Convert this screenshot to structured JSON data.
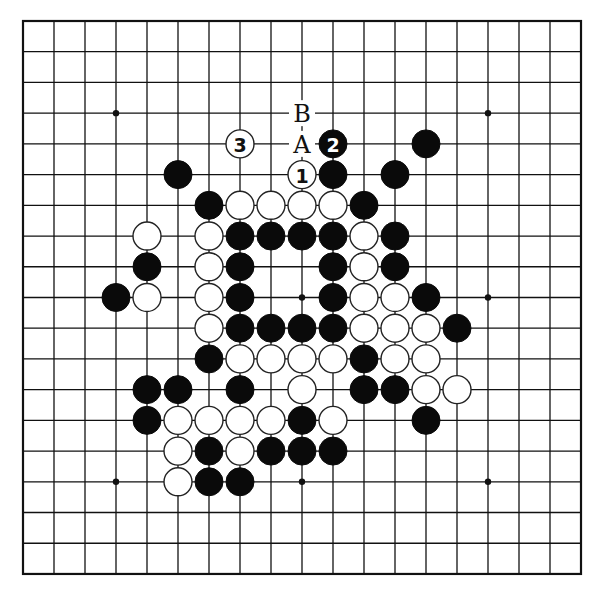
{
  "board": {
    "size": 19,
    "origin_x": 23,
    "origin_y": 21,
    "spacing_x": 31.0,
    "spacing_y": 30.72,
    "stone_radius": 14,
    "colors": {
      "black": "#0a0a0a",
      "white": "#ffffff",
      "line": "#111111"
    },
    "star_points": [
      [
        3,
        3
      ],
      [
        9,
        3
      ],
      [
        15,
        3
      ],
      [
        3,
        9
      ],
      [
        9,
        9
      ],
      [
        15,
        9
      ],
      [
        3,
        15
      ],
      [
        9,
        15
      ],
      [
        15,
        15
      ]
    ],
    "labels": [
      {
        "col": 9,
        "row": 3,
        "text": "B"
      },
      {
        "col": 9,
        "row": 4,
        "text": "A"
      }
    ],
    "stones": [
      {
        "col": 7,
        "row": 4,
        "color": "white",
        "number": "3"
      },
      {
        "col": 10,
        "row": 4,
        "color": "black",
        "number": "2"
      },
      {
        "col": 13,
        "row": 4,
        "color": "black"
      },
      {
        "col": 5,
        "row": 5,
        "color": "black"
      },
      {
        "col": 9,
        "row": 5,
        "color": "white",
        "number": "1"
      },
      {
        "col": 10,
        "row": 5,
        "color": "black"
      },
      {
        "col": 12,
        "row": 5,
        "color": "black"
      },
      {
        "col": 6,
        "row": 6,
        "color": "black"
      },
      {
        "col": 7,
        "row": 6,
        "color": "white"
      },
      {
        "col": 8,
        "row": 6,
        "color": "white"
      },
      {
        "col": 9,
        "row": 6,
        "color": "white"
      },
      {
        "col": 10,
        "row": 6,
        "color": "white"
      },
      {
        "col": 11,
        "row": 6,
        "color": "black"
      },
      {
        "col": 4,
        "row": 7,
        "color": "white"
      },
      {
        "col": 6,
        "row": 7,
        "color": "white"
      },
      {
        "col": 7,
        "row": 7,
        "color": "black"
      },
      {
        "col": 8,
        "row": 7,
        "color": "black"
      },
      {
        "col": 9,
        "row": 7,
        "color": "black"
      },
      {
        "col": 10,
        "row": 7,
        "color": "black"
      },
      {
        "col": 11,
        "row": 7,
        "color": "white"
      },
      {
        "col": 12,
        "row": 7,
        "color": "black"
      },
      {
        "col": 4,
        "row": 8,
        "color": "black"
      },
      {
        "col": 6,
        "row": 8,
        "color": "white"
      },
      {
        "col": 7,
        "row": 8,
        "color": "black"
      },
      {
        "col": 10,
        "row": 8,
        "color": "black"
      },
      {
        "col": 11,
        "row": 8,
        "color": "white"
      },
      {
        "col": 12,
        "row": 8,
        "color": "black"
      },
      {
        "col": 3,
        "row": 9,
        "color": "black"
      },
      {
        "col": 4,
        "row": 9,
        "color": "white"
      },
      {
        "col": 6,
        "row": 9,
        "color": "white"
      },
      {
        "col": 7,
        "row": 9,
        "color": "black"
      },
      {
        "col": 10,
        "row": 9,
        "color": "black"
      },
      {
        "col": 11,
        "row": 9,
        "color": "white"
      },
      {
        "col": 12,
        "row": 9,
        "color": "white"
      },
      {
        "col": 13,
        "row": 9,
        "color": "black"
      },
      {
        "col": 6,
        "row": 10,
        "color": "white"
      },
      {
        "col": 7,
        "row": 10,
        "color": "black"
      },
      {
        "col": 8,
        "row": 10,
        "color": "black"
      },
      {
        "col": 9,
        "row": 10,
        "color": "black"
      },
      {
        "col": 10,
        "row": 10,
        "color": "black"
      },
      {
        "col": 11,
        "row": 10,
        "color": "white"
      },
      {
        "col": 12,
        "row": 10,
        "color": "white"
      },
      {
        "col": 13,
        "row": 10,
        "color": "white"
      },
      {
        "col": 14,
        "row": 10,
        "color": "black"
      },
      {
        "col": 6,
        "row": 11,
        "color": "black"
      },
      {
        "col": 7,
        "row": 11,
        "color": "white"
      },
      {
        "col": 8,
        "row": 11,
        "color": "white"
      },
      {
        "col": 9,
        "row": 11,
        "color": "white"
      },
      {
        "col": 10,
        "row": 11,
        "color": "white"
      },
      {
        "col": 11,
        "row": 11,
        "color": "black"
      },
      {
        "col": 12,
        "row": 11,
        "color": "white"
      },
      {
        "col": 13,
        "row": 11,
        "color": "white"
      },
      {
        "col": 4,
        "row": 12,
        "color": "black"
      },
      {
        "col": 5,
        "row": 12,
        "color": "black"
      },
      {
        "col": 7,
        "row": 12,
        "color": "black"
      },
      {
        "col": 9,
        "row": 12,
        "color": "white"
      },
      {
        "col": 11,
        "row": 12,
        "color": "black"
      },
      {
        "col": 12,
        "row": 12,
        "color": "black"
      },
      {
        "col": 13,
        "row": 12,
        "color": "white"
      },
      {
        "col": 14,
        "row": 12,
        "color": "white"
      },
      {
        "col": 4,
        "row": 13,
        "color": "black"
      },
      {
        "col": 5,
        "row": 13,
        "color": "white"
      },
      {
        "col": 6,
        "row": 13,
        "color": "white"
      },
      {
        "col": 7,
        "row": 13,
        "color": "white"
      },
      {
        "col": 8,
        "row": 13,
        "color": "white"
      },
      {
        "col": 9,
        "row": 13,
        "color": "black"
      },
      {
        "col": 10,
        "row": 13,
        "color": "white"
      },
      {
        "col": 13,
        "row": 13,
        "color": "black"
      },
      {
        "col": 5,
        "row": 14,
        "color": "white"
      },
      {
        "col": 6,
        "row": 14,
        "color": "black"
      },
      {
        "col": 7,
        "row": 14,
        "color": "white"
      },
      {
        "col": 8,
        "row": 14,
        "color": "black"
      },
      {
        "col": 9,
        "row": 14,
        "color": "black"
      },
      {
        "col": 10,
        "row": 14,
        "color": "black"
      },
      {
        "col": 5,
        "row": 15,
        "color": "white"
      },
      {
        "col": 6,
        "row": 15,
        "color": "black"
      },
      {
        "col": 7,
        "row": 15,
        "color": "black"
      }
    ]
  }
}
